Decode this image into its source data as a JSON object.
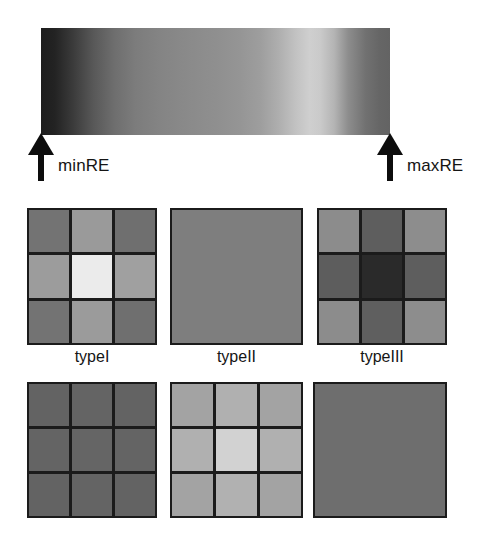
{
  "figure": {
    "colorbar": {
      "name": "relative-entropy-colorbar",
      "min_label": "minRE",
      "max_label": "maxRE",
      "orientation": "horizontal",
      "stops": [
        {
          "pos": 0,
          "color": "#1d1d1d"
        },
        {
          "pos": 4,
          "color": "#232323"
        },
        {
          "pos": 9,
          "color": "#3a3a3a"
        },
        {
          "pos": 15,
          "color": "#585858"
        },
        {
          "pos": 21,
          "color": "#6e6e6e"
        },
        {
          "pos": 27,
          "color": "#7c7c7c"
        },
        {
          "pos": 34,
          "color": "#848484"
        },
        {
          "pos": 42,
          "color": "#8a8a8a"
        },
        {
          "pos": 50,
          "color": "#8f8f8f"
        },
        {
          "pos": 57,
          "color": "#959595"
        },
        {
          "pos": 63,
          "color": "#9e9e9e"
        },
        {
          "pos": 68,
          "color": "#aeaeae"
        },
        {
          "pos": 73,
          "color": "#c2c2c2"
        },
        {
          "pos": 77,
          "color": "#cfcfcf"
        },
        {
          "pos": 80,
          "color": "#cacaca"
        },
        {
          "pos": 84,
          "color": "#b4b4b4"
        },
        {
          "pos": 88,
          "color": "#8d8d8d"
        },
        {
          "pos": 93,
          "color": "#717171"
        },
        {
          "pos": 97,
          "color": "#666666"
        },
        {
          "pos": 100,
          "color": "#636363"
        }
      ]
    },
    "row1": [
      {
        "name": "typeI",
        "label": "typeI",
        "gridlines": true,
        "cells": [
          "#737373",
          "#9a9a9a",
          "#6f6f6f",
          "#9c9c9c",
          "#ebebeb",
          "#a0a0a0",
          "#737373",
          "#9b9b9b",
          "#6f6f6f"
        ]
      },
      {
        "name": "typeII",
        "label": "typeII",
        "gridlines": false,
        "cells": [
          "#7e7e7e",
          "#7e7e7e",
          "#7e7e7e",
          "#7e7e7e",
          "#7e7e7e",
          "#7e7e7e",
          "#7e7e7e",
          "#7e7e7e",
          "#7e7e7e"
        ]
      },
      {
        "name": "typeIII",
        "label": "typeIII",
        "gridlines": true,
        "cells": [
          "#8c8c8c",
          "#5e5e5e",
          "#8d8d8d",
          "#5d5d5d",
          "#2a2a2a",
          "#5e5e5e",
          "#8c8c8c",
          "#5f5f5f",
          "#8d8d8d"
        ]
      }
    ],
    "row2": [
      {
        "name": "bottom-left",
        "label": "",
        "gridlines": true,
        "cells": [
          "#636363",
          "#646464",
          "#636363",
          "#646464",
          "#656565",
          "#646464",
          "#636363",
          "#646464",
          "#636363"
        ]
      },
      {
        "name": "bottom-middle",
        "label": "",
        "gridlines": true,
        "cells": [
          "#a3a3a3",
          "#b0b0b0",
          "#a3a3a3",
          "#b0b0b0",
          "#d2d2d2",
          "#b0b0b0",
          "#a3a3a3",
          "#b1b1b1",
          "#a3a3a3"
        ]
      },
      {
        "name": "bottom-right",
        "label": "",
        "gridlines": false,
        "cells": [
          "#6e6e6e",
          "#6e6e6e",
          "#6e6e6e",
          "#6e6e6e",
          "#6e6e6e",
          "#6e6e6e",
          "#6e6e6e",
          "#6e6e6e",
          "#6e6e6e"
        ]
      }
    ],
    "colors": {
      "ink": "#151515",
      "gridline": "#1b1b1b",
      "background": "#ffffff"
    }
  }
}
